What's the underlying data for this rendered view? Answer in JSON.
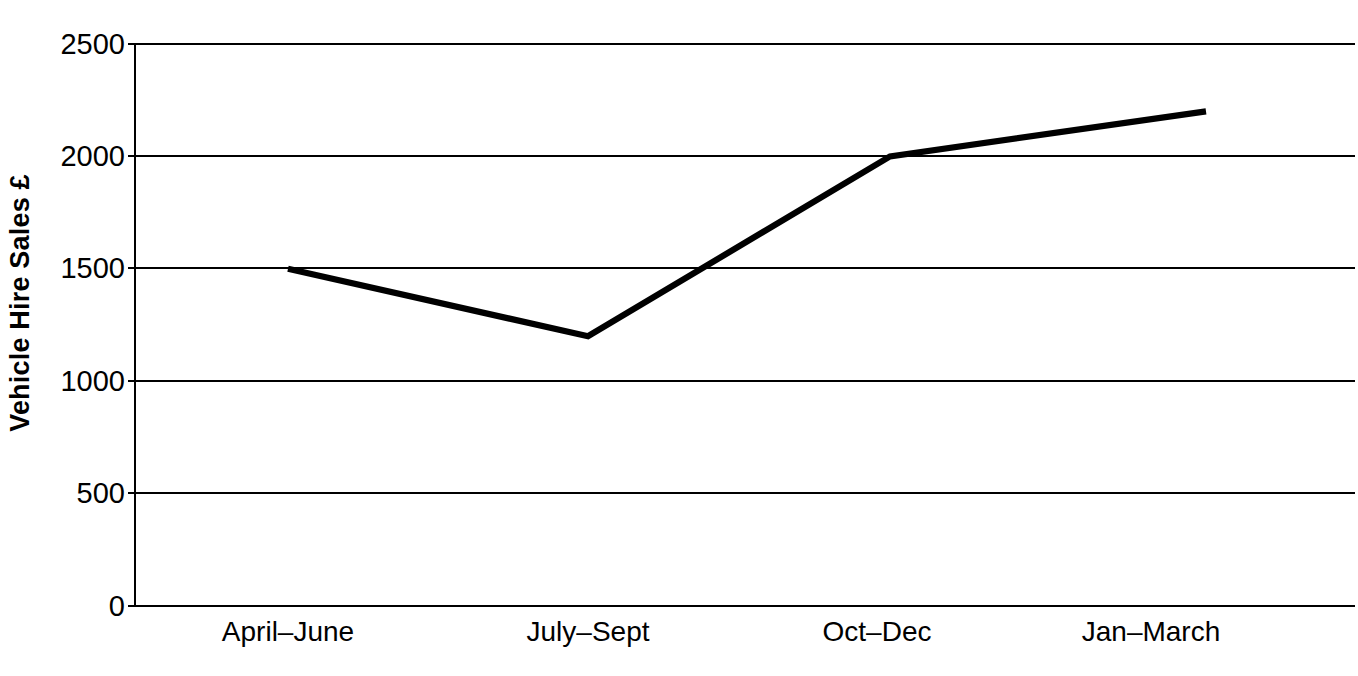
{
  "chart_data": {
    "type": "line",
    "title": "",
    "xlabel": "",
    "ylabel": "Vehicle Hire Sales £",
    "categories": [
      "April–June",
      "July–Sept",
      "Oct–Dec",
      "Jan–March"
    ],
    "values": [
      1500,
      1200,
      2000,
      2200
    ],
    "series": [
      {
        "name": "Vehicle Hire Sales",
        "values": [
          1500,
          1200,
          2000,
          2200
        ]
      }
    ],
    "ylim": [
      0,
      2500
    ],
    "ytick_labels": [
      "0",
      "500",
      "1000",
      "1500",
      "2000",
      "2500"
    ],
    "ytick_values": [
      0,
      500,
      1000,
      1500,
      2000,
      2500
    ],
    "grid": true,
    "grid_axis": "y",
    "legend": false,
    "legend_position": "none",
    "line_color": "#000000",
    "grid_color": "#000000",
    "background_color": "#ffffff",
    "markers": false
  },
  "axes": {
    "y_title": "Vehicle Hire Sales £",
    "y_ticks": [
      {
        "label": "2500",
        "value": 2500
      },
      {
        "label": "2000",
        "value": 2000
      },
      {
        "label": "1500",
        "value": 1500
      },
      {
        "label": "1000",
        "value": 1000
      },
      {
        "label": "500",
        "value": 500
      },
      {
        "label": "0",
        "value": 0
      }
    ],
    "x_ticks": [
      {
        "label": "April–June"
      },
      {
        "label": "July–Sept"
      },
      {
        "label": "Oct–Dec"
      },
      {
        "label": "Jan–March"
      }
    ]
  }
}
